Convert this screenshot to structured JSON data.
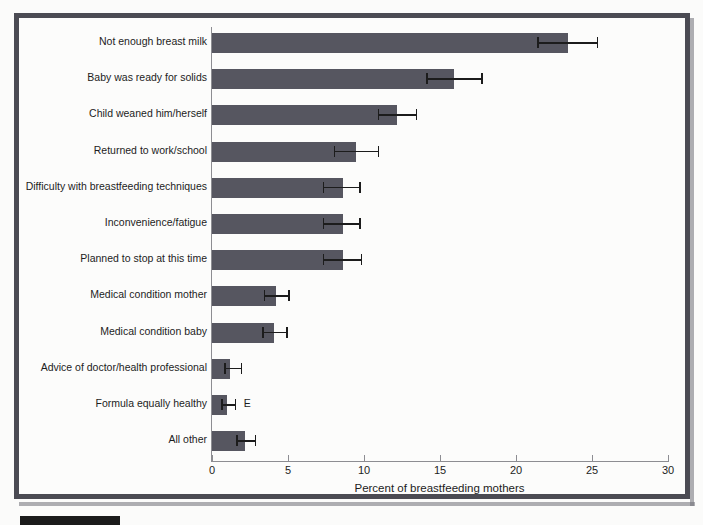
{
  "chart_data": {
    "type": "bar",
    "orientation": "horizontal",
    "title": "",
    "xlabel": "Percent of breastfeeding mothers",
    "ylabel": "",
    "xlim": [
      0,
      30
    ],
    "xticks": [
      0,
      5,
      10,
      15,
      20,
      25,
      30
    ],
    "grid": false,
    "legend": null,
    "error_bars": "95% confidence interval",
    "categories": [
      "Not enough breast milk",
      "Baby was ready for solids",
      "Child weaned him/herself",
      "Returned to work/school",
      "Difficulty with breastfeeding techniques",
      "Inconvenience/fatigue",
      "Planned to stop at this time",
      "Medical condition mother",
      "Medical condition baby",
      "Advice of doctor/health professional",
      "Formula equally healthy",
      "All other"
    ],
    "values": [
      23.4,
      15.9,
      12.2,
      9.5,
      8.6,
      8.6,
      8.6,
      4.2,
      4.1,
      1.2,
      1.0,
      2.2
    ],
    "err_low": [
      21.4,
      14.1,
      10.9,
      8.0,
      7.3,
      7.3,
      7.3,
      3.4,
      3.3,
      0.8,
      0.6,
      1.6
    ],
    "err_high": [
      25.3,
      17.7,
      13.4,
      10.9,
      9.7,
      9.7,
      9.8,
      5.0,
      4.9,
      1.9,
      1.5,
      2.8
    ],
    "annotations": [
      {
        "category": "Formula equally healthy",
        "text": "E"
      }
    ]
  },
  "colors": {
    "bar_fill": "#565660",
    "frame": "#4b4b53",
    "axis": "#8d8d92",
    "text": "#1d1d1d",
    "background": "#fcfcfb"
  }
}
